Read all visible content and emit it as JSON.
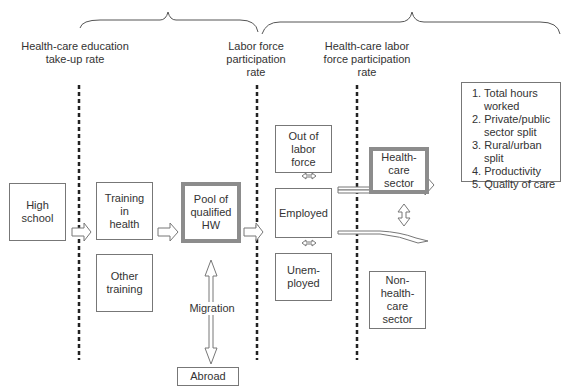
{
  "braces": {
    "left_brace_span": "Health-care education to Labor force participation",
    "right_brace_span": "Labor force participation to outcomes"
  },
  "headers": {
    "education_takeup": "Health-care education\ntake-up rate",
    "labor_force_participation": "Labor force\nparticipation\nrate",
    "healthcare_labor_participation": "Health-care labor\nforce participation\nrate"
  },
  "nodes": {
    "high_school": "High\nschool",
    "training_health": "Training\nin\nhealth",
    "other_training": "Other\ntraining",
    "pool_hw": "Pool of\nqualified\nHW",
    "out_of_labor_force": "Out of\nlabor\nforce",
    "employed": "Employed",
    "unemployed": "Unem-\nployed",
    "healthcare_sector": "Health-\ncare\nsector",
    "non_healthcare_sector": "Non-\nhealth-\ncare\nsector",
    "abroad": "Abroad"
  },
  "migration_label": "Migration",
  "outcomes": {
    "items": [
      "1. Total  hours worked",
      "2. Private/public sector split",
      "3. Rural/urban split",
      "4. Productivity",
      "5. Quality of care"
    ]
  },
  "colors": {
    "stroke": "#777777",
    "thick_border": "#8c8c8c",
    "text": "#333333",
    "dashed_line": "#222222"
  }
}
